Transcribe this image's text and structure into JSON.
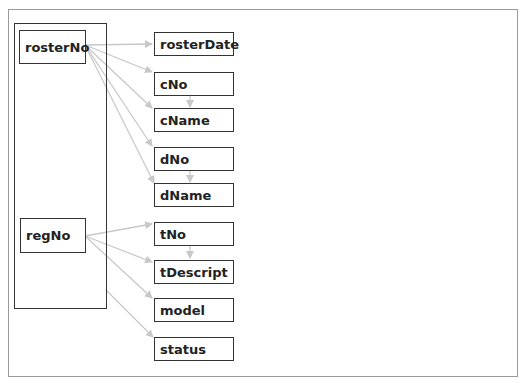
{
  "diagram": {
    "type": "functional-dependency-diagram",
    "edge_color": "#c8c8c8",
    "key_group": {
      "keys": [
        {
          "id": "rosterNo",
          "label": "rosterNo"
        },
        {
          "id": "regNo",
          "label": "regNo"
        }
      ]
    },
    "attributes": [
      {
        "id": "rosterDate",
        "label": "rosterDate"
      },
      {
        "id": "cNo",
        "label": "cNo"
      },
      {
        "id": "cName",
        "label": "cName"
      },
      {
        "id": "dNo",
        "label": "dNo"
      },
      {
        "id": "dName",
        "label": "dName"
      },
      {
        "id": "tNo",
        "label": "tNo"
      },
      {
        "id": "tDescript",
        "label": "tDescript"
      },
      {
        "id": "model",
        "label": "model"
      },
      {
        "id": "status",
        "label": "status"
      }
    ],
    "edges": [
      {
        "from": "rosterNo",
        "to": "rosterDate"
      },
      {
        "from": "rosterNo",
        "to": "cNo"
      },
      {
        "from": "rosterNo",
        "to": "cName"
      },
      {
        "from": "rosterNo",
        "to": "dNo"
      },
      {
        "from": "rosterNo",
        "to": "dName"
      },
      {
        "from": "cNo",
        "to": "cName"
      },
      {
        "from": "dNo",
        "to": "dName"
      },
      {
        "from": "regNo",
        "to": "tNo"
      },
      {
        "from": "regNo",
        "to": "tDescript"
      },
      {
        "from": "regNo",
        "to": "model"
      },
      {
        "from": "tNo",
        "to": "tDescript"
      },
      {
        "from": "key_group",
        "to": "status"
      }
    ]
  }
}
